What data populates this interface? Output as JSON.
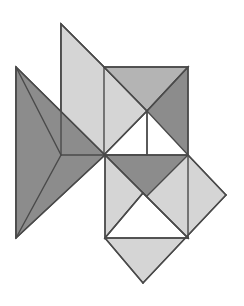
{
  "figure": {
    "title": "Abstract Tangram Composition",
    "type": "geometric-line-figure",
    "width": 244,
    "height": 306,
    "background_color": "#ffffff",
    "stroke_color": "#4a4a4a",
    "stroke_width": 1.4,
    "palette": {
      "dark_gray": "#8c8c8c",
      "medium_gray": "#b4b4b4",
      "light_gray": "#d5d5d5",
      "pale_gray": "#cfcfcf",
      "white": "#ffffff",
      "outline": "#4a4a4a"
    },
    "shapes": [
      {
        "name": "upper-left-light-wing",
        "fill": "#d5d5d5",
        "points": "61,24 61,155 104,67"
      },
      {
        "name": "upper-light-parallelogram",
        "fill": "#d5d5d5",
        "points": "61,24 104,67 147,111 105,155 61,155"
      },
      {
        "name": "top-right-square-left-triangle",
        "fill": "#d5d5d5",
        "points": "104,67 147,111 104,155"
      },
      {
        "name": "top-right-square-top-triangle",
        "fill": "#b4b4b4",
        "points": "104,67 188,67 147,111"
      },
      {
        "name": "top-right-square-right-triangle",
        "fill": "#8c8c8c",
        "points": "188,67 188,155 147,111"
      },
      {
        "name": "top-right-square-bottom-notch",
        "fill": "#ffffff",
        "points": "104,155 147,111 147,155"
      },
      {
        "name": "left-dark-wing-upper",
        "fill": "#8c8c8c",
        "points": "16,67 105,155 16,238"
      },
      {
        "name": "left-dark-wing-lower",
        "fill": "#8c8c8c",
        "points": "16,67 61,155 16,238"
      },
      {
        "name": "center-dark-bowtie-right",
        "fill": "#8c8c8c",
        "points": "105,155 188,238 188,155"
      },
      {
        "name": "lower-light-diamond-left",
        "fill": "#d5d5d5",
        "points": "105,155 143,193 105,238"
      },
      {
        "name": "lower-light-diamond-body",
        "fill": "#d5d5d5",
        "points": "188,155 226,195 143,283 105,238"
      },
      {
        "name": "lower-white-triangle",
        "fill": "#ffffff",
        "points": "105,238 143,193 188,238"
      }
    ],
    "edges": [
      "61,24 104,67",
      "61,24 61,155",
      "104,67 188,67",
      "188,67 188,155",
      "104,67 147,111",
      "188,67 147,111",
      "147,111 147,155",
      "104,155 147,111",
      "16,67 105,155",
      "16,67 16,238",
      "16,238 105,155",
      "61,155 105,155",
      "105,155 188,238",
      "188,155 188,238",
      "105,155 188,155",
      "188,155 226,195",
      "226,195 143,283",
      "143,283 105,238",
      "105,238 105,155",
      "105,238 188,238",
      "143,193 105,238",
      "143,193 188,238"
    ]
  }
}
